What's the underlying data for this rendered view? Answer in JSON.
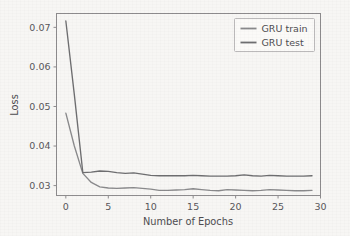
{
  "chart_data": {
    "type": "line",
    "title": "",
    "xlabel": "Number of Epochs",
    "ylabel": "Loss",
    "xlim": [
      -1.1,
      30.0
    ],
    "ylim": [
      0.0275,
      0.0735
    ],
    "xticks": [
      0,
      5,
      10,
      15,
      20,
      25,
      30
    ],
    "xtick_labels": [
      "0",
      "5",
      "10",
      "15",
      "20",
      "25",
      "30"
    ],
    "yticks": [
      0.03,
      0.04,
      0.05,
      0.06,
      0.07
    ],
    "ytick_labels": [
      "0.03",
      "0.04",
      "0.05",
      "0.06",
      "0.07"
    ],
    "grid": false,
    "legend_position": "upper right",
    "x": [
      0,
      1,
      2,
      3,
      4,
      5,
      6,
      7,
      8,
      9,
      10,
      11,
      12,
      13,
      14,
      15,
      16,
      17,
      18,
      19,
      20,
      21,
      22,
      23,
      24,
      25,
      26,
      27,
      28,
      29
    ],
    "series": [
      {
        "name": "GRU train",
        "color": "#8a8a8c",
        "values": [
          0.0483,
          0.04,
          0.0331,
          0.0308,
          0.0297,
          0.0294,
          0.0293,
          0.0294,
          0.0295,
          0.0293,
          0.0291,
          0.0288,
          0.0288,
          0.0289,
          0.029,
          0.0292,
          0.029,
          0.0288,
          0.0287,
          0.029,
          0.0289,
          0.0288,
          0.0287,
          0.0288,
          0.029,
          0.0289,
          0.0288,
          0.0287,
          0.0287,
          0.0288
        ]
      },
      {
        "name": "GRU test",
        "color": "#6e6e70",
        "values": [
          0.0716,
          0.053,
          0.0333,
          0.0334,
          0.0337,
          0.0336,
          0.0333,
          0.0331,
          0.0332,
          0.0329,
          0.0326,
          0.0325,
          0.0325,
          0.0325,
          0.0325,
          0.0326,
          0.0325,
          0.0324,
          0.0324,
          0.0324,
          0.0325,
          0.0327,
          0.0325,
          0.0324,
          0.0326,
          0.0325,
          0.0324,
          0.0324,
          0.0324,
          0.0325
        ]
      }
    ]
  },
  "legend": {
    "entries": [
      {
        "label": "GRU train"
      },
      {
        "label": "GRU test"
      }
    ]
  },
  "axes": {
    "x_title": "Number of Epochs",
    "y_title": "Loss"
  },
  "colors": {
    "background": "#f7f6f4",
    "axis": "#8e8c8e",
    "text": "#4e4c50",
    "train": "#8a8a8c",
    "test": "#6e6e70"
  }
}
